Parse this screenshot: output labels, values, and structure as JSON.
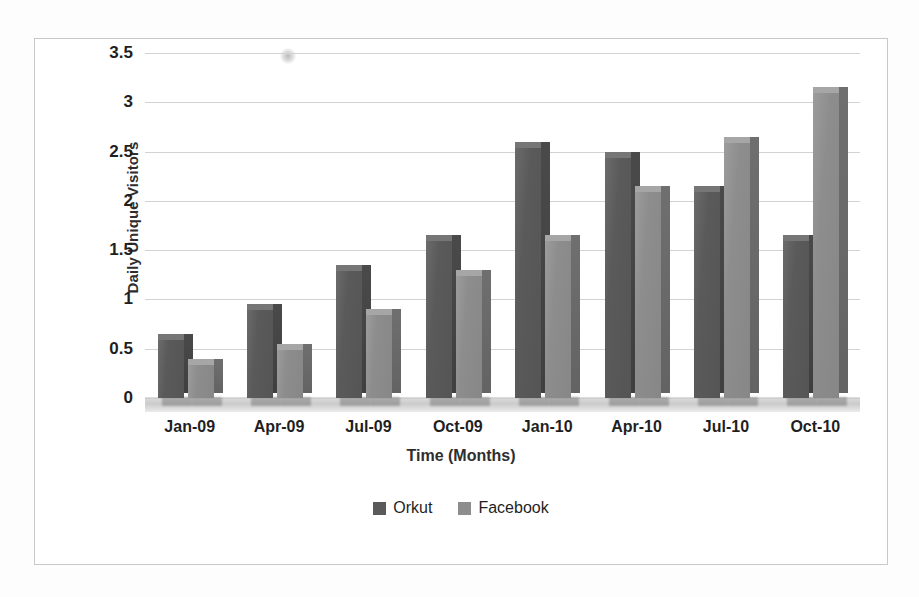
{
  "chart_data": {
    "type": "bar",
    "title": "",
    "xlabel": "Time (Months)",
    "ylabel": "Daily Unique Visitors",
    "categories": [
      "Jan-09",
      "Apr-09",
      "Jul-09",
      "Oct-09",
      "Jan-10",
      "Apr-10",
      "Jul-10",
      "Oct-10"
    ],
    "series": [
      {
        "name": "Orkut",
        "color": "#5a5a5a",
        "values": [
          0.6,
          0.9,
          1.3,
          1.6,
          2.55,
          2.45,
          2.1,
          1.6
        ]
      },
      {
        "name": "Facebook",
        "color": "#8d8d8d",
        "values": [
          0.35,
          0.5,
          0.85,
          1.25,
          1.6,
          2.1,
          2.6,
          3.1
        ]
      }
    ],
    "ylim": [
      0,
      3.5
    ],
    "ytick_labels": [
      "0",
      "0.5",
      "1",
      "1.5",
      "2",
      "2.5",
      "3",
      "3.5"
    ],
    "ytick_values": [
      0,
      0.5,
      1,
      1.5,
      2,
      2.5,
      3,
      3.5
    ],
    "grid": true,
    "legend_position": "bottom",
    "style_3d": true
  },
  "legend": {
    "items": [
      {
        "label": "Orkut"
      },
      {
        "label": "Facebook"
      }
    ]
  },
  "colors": {
    "orkut": "#5a5a5a",
    "facebook": "#8d8d8d",
    "gridline": "#d2d2d2",
    "frame_border": "#c9c9c9",
    "page_background": "#fdfdfd",
    "plot_background": "#ffffff",
    "text": "#1f1f1f"
  }
}
